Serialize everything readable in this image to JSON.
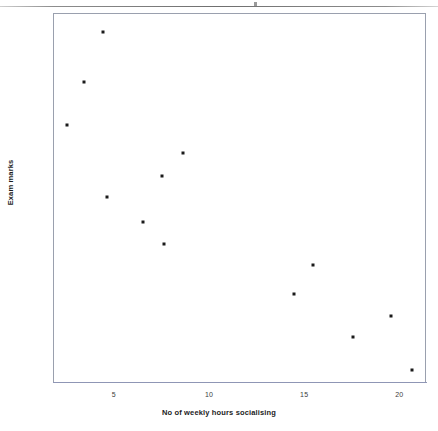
{
  "page": {
    "background_color": "#ffffff",
    "edge_line_color": "#6f6f6f"
  },
  "chart_data": {
    "type": "scatter",
    "title": "",
    "subtitle": "",
    "xlabel": "No of weekly hours socialising",
    "ylabel": "Exam marks",
    "xlim": [
      1.8,
      21.4
    ],
    "ylim": [
      36.5,
      88.0
    ],
    "xticks": [
      5,
      10,
      15,
      20
    ],
    "yticks": [
      40,
      50,
      60,
      70,
      80
    ],
    "xtick_labels": [
      "5",
      "10",
      "15",
      "20"
    ],
    "ytick_labels": [
      "40",
      "50",
      "60",
      "70",
      "80"
    ],
    "grid": false,
    "legend": false,
    "legend_position": "none",
    "marker_color": "#1a1a1a",
    "marker_size_px": 3,
    "frame_color": "#9aa0ae",
    "n_points": 13,
    "series": [
      {
        "name": "students",
        "points": [
          {
            "x": 2.5,
            "y": 72.5
          },
          {
            "x": 3.4,
            "y": 78.6
          },
          {
            "x": 4.4,
            "y": 85.5
          },
          {
            "x": 4.6,
            "y": 62.5
          },
          {
            "x": 6.5,
            "y": 59.0
          },
          {
            "x": 7.5,
            "y": 65.5
          },
          {
            "x": 7.6,
            "y": 56.0
          },
          {
            "x": 8.6,
            "y": 68.6
          },
          {
            "x": 14.4,
            "y": 49.0
          },
          {
            "x": 15.4,
            "y": 53.0
          },
          {
            "x": 17.5,
            "y": 43.0
          },
          {
            "x": 19.5,
            "y": 46.0
          },
          {
            "x": 20.6,
            "y": 38.5
          }
        ]
      }
    ]
  }
}
